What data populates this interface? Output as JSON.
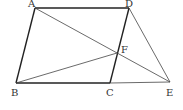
{
  "diagram": {
    "type": "geometry",
    "points": {
      "A": {
        "label": "A",
        "x": 35,
        "y": 8,
        "lx": 28,
        "ly": 7
      },
      "D": {
        "label": "D",
        "x": 129,
        "y": 8,
        "lx": 125,
        "ly": 7
      },
      "B": {
        "label": "B",
        "x": 16,
        "y": 83,
        "lx": 11,
        "ly": 96
      },
      "C": {
        "label": "C",
        "x": 110,
        "y": 83,
        "lx": 106,
        "ly": 96
      },
      "E": {
        "label": "E",
        "x": 170,
        "y": 82,
        "lx": 166,
        "ly": 96
      },
      "F": {
        "label": "F",
        "x": 117,
        "y": 53,
        "lx": 121,
        "ly": 53
      }
    },
    "thick_segments": [
      "AB",
      "AD",
      "BC",
      "CD"
    ],
    "thin_segments": [
      "AE",
      "BF",
      "DE",
      "CE"
    ]
  }
}
